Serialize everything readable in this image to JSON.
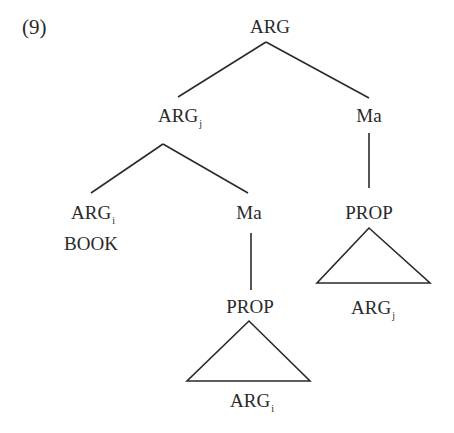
{
  "example_number": "(9)",
  "tree": {
    "root": {
      "label": "ARG",
      "subscript": ""
    },
    "left": {
      "label": "ARG",
      "subscript": "j"
    },
    "right": {
      "label": "Ma",
      "subscript": ""
    },
    "left_left": {
      "label": "ARG",
      "subscript": "i",
      "gloss": "BOOK"
    },
    "left_right": {
      "label": "Ma",
      "subscript": ""
    },
    "left_right_child": {
      "label": "PROP",
      "subscript": ""
    },
    "left_right_triangle_leaf": {
      "label": "ARG",
      "subscript": "i"
    },
    "right_child": {
      "label": "PROP",
      "subscript": ""
    },
    "right_triangle_leaf": {
      "label": "ARG",
      "subscript": "j"
    }
  }
}
